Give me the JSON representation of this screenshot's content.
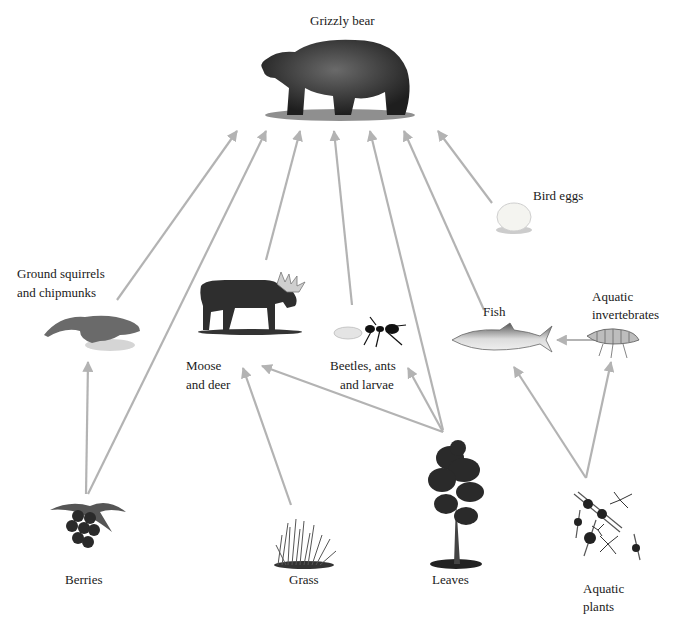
{
  "diagram": {
    "type": "food-web",
    "arrow_color": "#b3b3b3",
    "nodes": [
      {
        "id": "grizzly-bear",
        "label": "Grizzly bear",
        "level": "top-predator"
      },
      {
        "id": "ground-squirrels",
        "label_line1": "Ground squirrels",
        "label_line2": "and chipmunks"
      },
      {
        "id": "moose-deer",
        "label_line1": "Moose",
        "label_line2": "and deer"
      },
      {
        "id": "beetles",
        "label_line1": "Beetles, ants",
        "label_line2": "and larvae"
      },
      {
        "id": "fish",
        "label": "Fish"
      },
      {
        "id": "bird-eggs",
        "label": "Bird eggs"
      },
      {
        "id": "aquatic-invertebrates",
        "label_line1": "Aquatic",
        "label_line2": "invertebrates"
      },
      {
        "id": "berries",
        "label": "Berries"
      },
      {
        "id": "grass",
        "label": "Grass"
      },
      {
        "id": "leaves",
        "label": "Leaves"
      },
      {
        "id": "aquatic-plants",
        "label_line1": "Aquatic",
        "label_line2": "plants"
      }
    ],
    "edges": [
      {
        "from": "ground-squirrels",
        "to": "grizzly-bear"
      },
      {
        "from": "berries",
        "to": "grizzly-bear"
      },
      {
        "from": "moose-deer",
        "to": "grizzly-bear"
      },
      {
        "from": "beetles",
        "to": "grizzly-bear"
      },
      {
        "from": "leaves",
        "to": "grizzly-bear"
      },
      {
        "from": "fish",
        "to": "grizzly-bear"
      },
      {
        "from": "bird-eggs",
        "to": "grizzly-bear"
      },
      {
        "from": "berries",
        "to": "ground-squirrels"
      },
      {
        "from": "grass",
        "to": "moose-deer"
      },
      {
        "from": "leaves",
        "to": "moose-deer"
      },
      {
        "from": "leaves",
        "to": "beetles"
      },
      {
        "from": "aquatic-invertebrates",
        "to": "fish"
      },
      {
        "from": "aquatic-plants",
        "to": "fish"
      },
      {
        "from": "aquatic-plants",
        "to": "aquatic-invertebrates"
      }
    ]
  },
  "labels": {
    "bear": "Grizzly bear",
    "squirrels_1": "Ground squirrels",
    "squirrels_2": "and chipmunks",
    "moose_1": "Moose",
    "moose_2": "and deer",
    "beetles_1": "Beetles, ants",
    "beetles_2": "and larvae",
    "fish": "Fish",
    "eggs": "Bird eggs",
    "invert_1": "Aquatic",
    "invert_2": "invertebrates",
    "berries": "Berries",
    "grass": "Grass",
    "leaves": "Leaves",
    "plants_1": "Aquatic",
    "plants_2": "plants"
  }
}
